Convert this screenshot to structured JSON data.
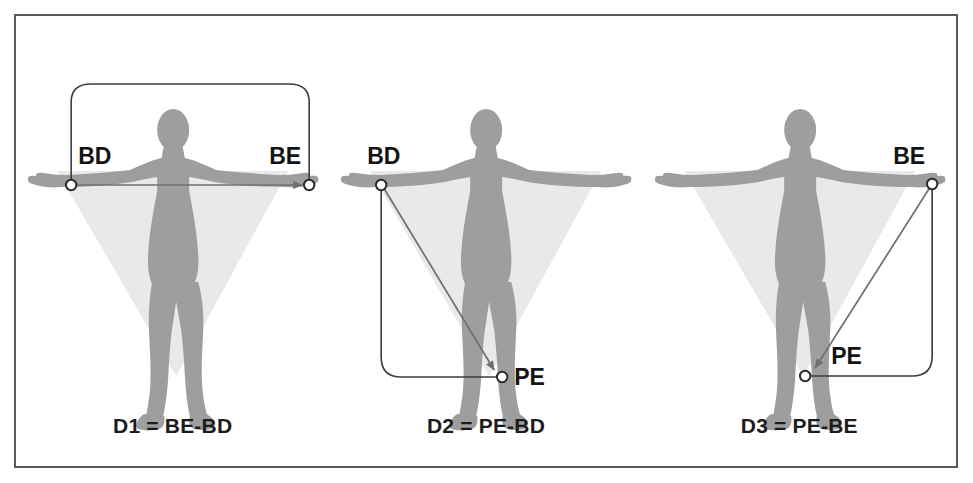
{
  "figure": {
    "title_visible": false,
    "border_color": "#5a5a5e",
    "background": "#ffffff",
    "body_color": "#9e9e9e",
    "cone_color": "#e9e9e9",
    "line_color": "#3c3c3c",
    "marker_fill": "#ffffff",
    "marker_stroke": "#2b2b2b",
    "text_color": "#1c1c1c"
  },
  "panels": [
    {
      "id": "panel-d1",
      "caption": "D1 = BE-BD",
      "labels": [
        {
          "name": "BD",
          "text": "BD"
        },
        {
          "name": "BE",
          "text": "BE"
        }
      ],
      "markers": [
        "BD",
        "BE"
      ],
      "measure": "BE-BD",
      "result": "D1"
    },
    {
      "id": "panel-d2",
      "caption": "D2 = PE-BD",
      "labels": [
        {
          "name": "BD",
          "text": "BD"
        },
        {
          "name": "PE",
          "text": "PE"
        }
      ],
      "markers": [
        "BD",
        "PE"
      ],
      "measure": "PE-BD",
      "result": "D2"
    },
    {
      "id": "panel-d3",
      "caption": "D3 = PE-BE",
      "labels": [
        {
          "name": "BE",
          "text": "BE"
        },
        {
          "name": "PE",
          "text": "PE"
        }
      ],
      "markers": [
        "PE",
        "BE"
      ],
      "measure": "PE-BE",
      "result": "D3"
    }
  ],
  "legend": {
    "BD": "BD",
    "BE": "BE",
    "PE": "PE",
    "D1": "D1",
    "D2": "D2",
    "D3": "D3"
  }
}
